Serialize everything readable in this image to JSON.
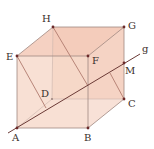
{
  "diagram": {
    "type": "cube",
    "colors": {
      "face_fill": "#f6d3c4",
      "face_fill_top": "#f3c8b6",
      "edge": "#a08880",
      "line_g": "#6b3a36",
      "inner_line": "#b07a6e",
      "point": "#6b2a2a",
      "label": "#3a2e2a"
    },
    "vertices": [
      {
        "id": "A",
        "label": "A",
        "x": 17,
        "y": 128,
        "lx": 12,
        "ly": 141
      },
      {
        "id": "B",
        "label": "B",
        "x": 88,
        "y": 128,
        "lx": 84,
        "ly": 141
      },
      {
        "id": "C",
        "label": "C",
        "x": 124,
        "y": 99,
        "lx": 128,
        "ly": 107
      },
      {
        "id": "D",
        "label": "D",
        "x": 52,
        "y": 99,
        "lx": 41,
        "ly": 97
      },
      {
        "id": "E",
        "label": "E",
        "x": 17,
        "y": 56,
        "lx": 6,
        "ly": 60
      },
      {
        "id": "F",
        "label": "F",
        "x": 88,
        "y": 56,
        "lx": 92,
        "ly": 64
      },
      {
        "id": "G",
        "label": "G",
        "x": 124,
        "y": 27,
        "lx": 128,
        "ly": 29
      },
      {
        "id": "H",
        "label": "H",
        "x": 53,
        "y": 27,
        "lx": 42,
        "ly": 22
      },
      {
        "id": "M",
        "label": "M",
        "x": 124,
        "y": 63,
        "lx": 125,
        "ly": 74
      }
    ],
    "line_g": {
      "label": "g",
      "x1": 8,
      "y1": 133,
      "x2": 140,
      "y2": 54,
      "lx": 142,
      "ly": 52
    }
  }
}
